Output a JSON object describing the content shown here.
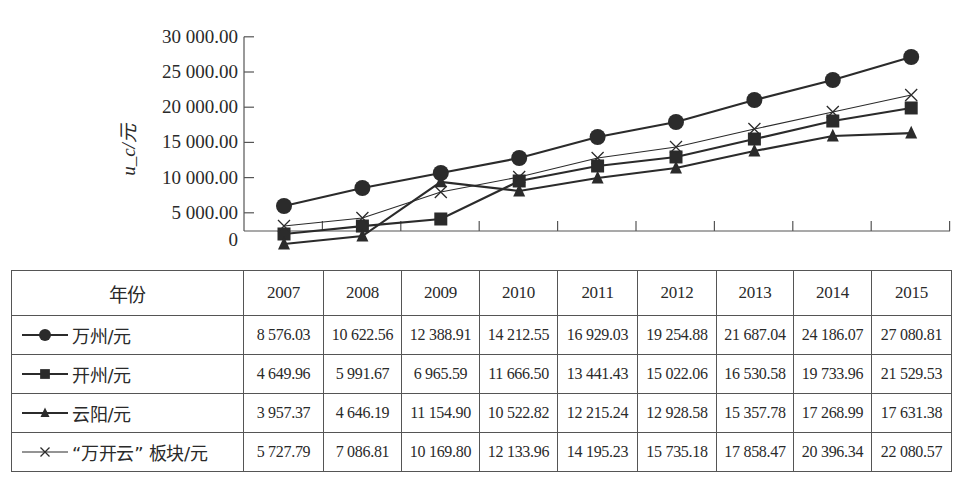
{
  "chart_data": {
    "type": "line",
    "title": "",
    "xlabel": "",
    "ylabel": "u_c/元",
    "ylim": [
      0,
      30000
    ],
    "y_ticks": [
      "0",
      "5 000.00",
      "10 000.00",
      "15 000.00",
      "20 000.00",
      "25 000.00",
      "30 000.00"
    ],
    "grid": false,
    "legend_position": "table-left-column",
    "categories": [
      "2007",
      "2008",
      "2009",
      "2010",
      "2011",
      "2012",
      "2013",
      "2014",
      "2015"
    ],
    "series": [
      {
        "name": "万州/元",
        "marker": "circle",
        "values": [
          5970,
          8520,
          10650,
          12780,
          15770,
          17900,
          21020,
          23860,
          27130
        ]
      },
      {
        "name": "开州/元",
        "marker": "square",
        "values": [
          1990,
          3120,
          4120,
          9520,
          11650,
          12930,
          15480,
          18040,
          19890
        ]
      },
      {
        "name": "云阳/元",
        "marker": "triangle",
        "values": [
          570,
          1700,
          9380,
          8100,
          9940,
          11360,
          13780,
          15910,
          16330
        ]
      },
      {
        "name": "“万开云”板块/元",
        "marker": "x",
        "values": [
          3120,
          4260,
          7950,
          10090,
          12780,
          14350,
          16900,
          19320,
          21730
        ]
      }
    ]
  },
  "table": {
    "header_label": "年份",
    "years": [
      "2007",
      "2008",
      "2009",
      "2010",
      "2011",
      "2012",
      "2013",
      "2014",
      "2015"
    ],
    "rows": [
      {
        "label": "万州/元",
        "marker": "circle",
        "values": [
          "8 576.03",
          "10 622.56",
          "12 388.91",
          "14 212.55",
          "16 929.03",
          "19 254.88",
          "21 687.04",
          "24 186.07",
          "27 080.81"
        ]
      },
      {
        "label": "开州/元",
        "marker": "square",
        "values": [
          "4 649.96",
          "5 991.67",
          "6 965.59",
          "11 666.50",
          "13 441.43",
          "15 022.06",
          "16 530.58",
          "19 733.96",
          "21 529.53"
        ]
      },
      {
        "label": "云阳/元",
        "marker": "triangle",
        "values": [
          "3 957.37",
          "4 646.19",
          "11 154.90",
          "10 522.82",
          "12 215.24",
          "12 928.58",
          "15 357.78",
          "17 268.99",
          "17 631.38"
        ]
      },
      {
        "label": "“万开云” 板块/元",
        "marker": "x",
        "values": [
          "5 727.79",
          "7 086.81",
          "10 169.80",
          "12 133.96",
          "14 195.23",
          "15 735.18",
          "17 858.47",
          "20 396.34",
          "22 080.57"
        ]
      }
    ]
  },
  "colors": {
    "line": "#2b2b2b",
    "axis": "#555555",
    "background": "#ffffff"
  }
}
